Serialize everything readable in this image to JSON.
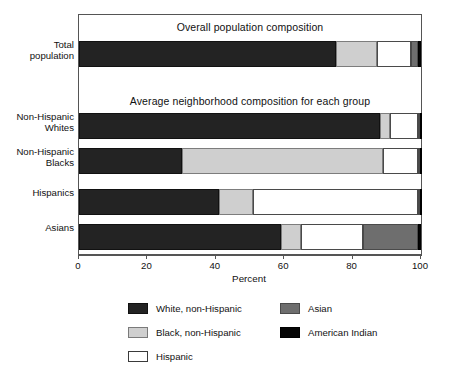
{
  "chart_data": {
    "type": "bar",
    "orientation": "horizontal",
    "stacked": true,
    "title": "",
    "panel_titles": {
      "top": "Overall population composition",
      "bottom": "Average neighborhood composition for each group"
    },
    "xlabel": "Percent",
    "ylabel": "",
    "xlim": [
      0,
      100
    ],
    "xticks": [
      0,
      20,
      40,
      60,
      80,
      100
    ],
    "xticklabels": [
      "0",
      "20",
      "40",
      "60",
      "80",
      "100"
    ],
    "grid": false,
    "legend_position": "below-axes",
    "categories": [
      "Total population",
      "Non-Hispanic Whites",
      "Non-Hispanic Blacks",
      "Hispanics",
      "Asians"
    ],
    "category_labels": [
      [
        "Total",
        "population"
      ],
      [
        "Non-Hispanic",
        "Whites"
      ],
      [
        "Non-Hispanic",
        "Blacks"
      ],
      [
        "Hispanics"
      ],
      [
        "Asians"
      ]
    ],
    "series": [
      {
        "name": "White, non-Hispanic",
        "key": "white_nh",
        "color": "#232323",
        "values": [
          75,
          88,
          30,
          41,
          59
        ]
      },
      {
        "name": "Black, non-Hispanic",
        "key": "black_nh",
        "color": "#cfcfcf",
        "values": [
          12,
          3,
          59,
          10,
          6
        ]
      },
      {
        "name": "Hispanic",
        "key": "hispanic",
        "color": "#ffffff",
        "values": [
          10,
          8,
          10,
          48,
          18
        ]
      },
      {
        "name": "Asian",
        "key": "asian",
        "color": "#6e6e6e",
        "values": [
          2,
          0.5,
          0.5,
          0.5,
          16
        ]
      },
      {
        "name": "American Indian",
        "key": "amerind",
        "color": "#050505",
        "values": [
          1,
          0.5,
          0.5,
          0.5,
          1
        ]
      }
    ]
  },
  "legend": {
    "items": [
      {
        "label": "White, non-Hispanic",
        "swatch": "sw-dark"
      },
      {
        "label": "Black, non-Hispanic",
        "swatch": "sw-lgray"
      },
      {
        "label": "Hispanic",
        "swatch": "sw-white"
      },
      {
        "label": "Asian",
        "swatch": "sw-mgray"
      },
      {
        "label": "American Indian",
        "swatch": "sw-black"
      }
    ]
  }
}
